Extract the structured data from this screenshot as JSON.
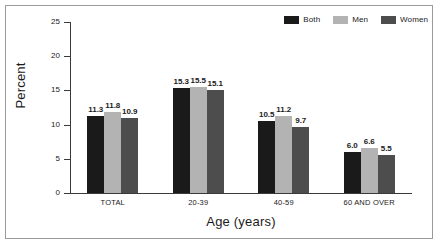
{
  "figure": {
    "background": "#ffffff",
    "border_color": "#9a9a9a"
  },
  "chart_data": {
    "type": "bar",
    "title": "",
    "subtitle": "",
    "xlabel": "Age (years)",
    "ylabel": "Percent",
    "categories": [
      "TOTAL",
      "20-39",
      "40-59",
      "60 AND OVER"
    ],
    "series": [
      {
        "name": "Both",
        "color": "#1a1a1a",
        "values": [
          11.3,
          15.3,
          10.5,
          6.0
        ]
      },
      {
        "name": "Men",
        "color": "#b3b3b3",
        "values": [
          11.8,
          15.5,
          11.2,
          6.6
        ]
      },
      {
        "name": "Women",
        "color": "#4d4d4d",
        "values": [
          10.9,
          15.1,
          9.7,
          5.5
        ]
      }
    ],
    "value_labels": [
      [
        "11.3",
        "11.8",
        "10.9"
      ],
      [
        "15.3",
        "15.5",
        "15.1"
      ],
      [
        "10.5",
        "11.2",
        "9.7"
      ],
      [
        "6.0",
        "6.6",
        "5.5"
      ]
    ],
    "ylim": [
      0,
      25
    ],
    "yticks": [
      0,
      5,
      10,
      15,
      20,
      25
    ],
    "ytick_labels": [
      "0",
      "5",
      "10",
      "15",
      "20",
      "25"
    ],
    "grid": false,
    "legend_position": "top-right",
    "legend": [
      "Both",
      "Men",
      "Women"
    ]
  }
}
